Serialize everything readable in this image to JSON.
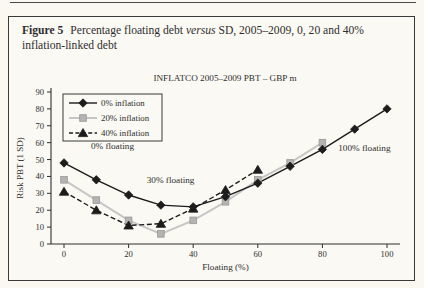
{
  "figure": {
    "caption_label": "Figure 5",
    "caption_text_1": "Percentage floating debt ",
    "caption_italic": "versus",
    "caption_text_2": " SD, 2005–2009, 0, 20 and 40% inflation-linked debt"
  },
  "chart_data": {
    "type": "line",
    "title": "INFLATCO 2005–2009 PBT – GBP m",
    "xlabel": "Floating (%)",
    "ylabel": "Risk PBT (1 SD)",
    "xlim": [
      0,
      100
    ],
    "ylim": [
      0,
      90
    ],
    "xticks": [
      0,
      20,
      40,
      60,
      80,
      100
    ],
    "yticks": [
      0,
      10,
      20,
      30,
      40,
      50,
      60,
      70,
      80,
      90
    ],
    "grid": false,
    "legend_position": "top-left",
    "series": [
      {
        "name": "0% inflation",
        "marker": "diamond",
        "line": "solid",
        "color": "#1c1c1c",
        "marker_fill": "#1c1c1c",
        "marker_stroke": "#1c1c1c",
        "x": [
          0,
          10,
          20,
          30,
          40,
          50,
          60,
          70,
          80,
          90,
          100
        ],
        "values": [
          48,
          38,
          29,
          23,
          22,
          28,
          36,
          46,
          56,
          68,
          80
        ]
      },
      {
        "name": "20% inflation",
        "marker": "square",
        "line": "solid",
        "color": "#c6c6c6",
        "marker_fill": "#b4b4b4",
        "marker_stroke": "#979797",
        "x": [
          0,
          10,
          20,
          30,
          40,
          50,
          60,
          70,
          80
        ],
        "values": [
          38,
          26,
          14,
          6,
          14,
          25,
          38,
          48,
          60
        ]
      },
      {
        "name": "40% inflation",
        "marker": "triangle",
        "line": "dashed",
        "color": "#1c1c1c",
        "marker_fill": "#1c1c1c",
        "marker_stroke": "#1c1c1c",
        "x": [
          0,
          10,
          20,
          30,
          40,
          50,
          60
        ],
        "values": [
          31,
          20,
          11,
          12,
          21,
          32,
          44
        ]
      }
    ],
    "annotations": [
      {
        "text": "0% floating",
        "x": 15,
        "y": 58
      },
      {
        "text": "30% floating",
        "x": 33,
        "y": 38
      },
      {
        "text": "100% floating",
        "x": 93,
        "y": 57
      }
    ]
  }
}
